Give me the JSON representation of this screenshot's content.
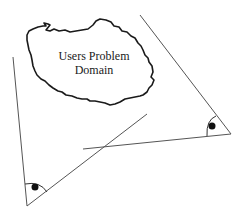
{
  "diagram": {
    "cloud": {
      "label_line1": "Users Problem",
      "label_line2": "Domain"
    },
    "colors": {
      "stroke": "#1a1a1a",
      "line": "#555555",
      "background": "#ffffff"
    }
  }
}
